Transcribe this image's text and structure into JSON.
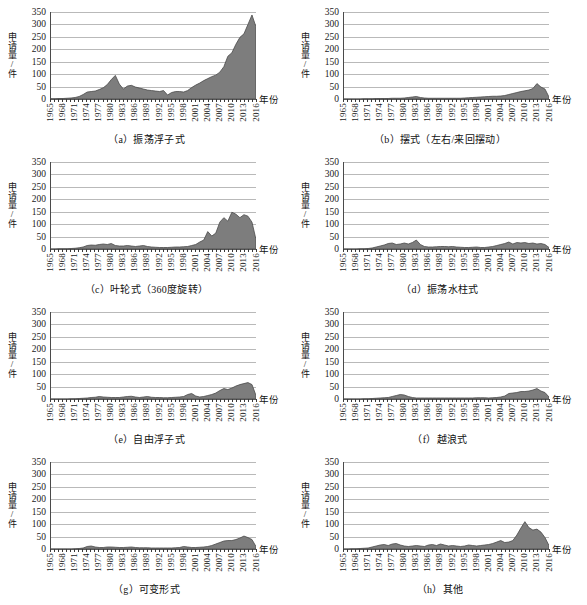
{
  "figure": {
    "axis_titles": {
      "y": "申请量/件",
      "x": "年份"
    },
    "y_ticks": [
      0,
      50,
      100,
      150,
      200,
      250,
      300,
      350
    ],
    "y_range": [
      0,
      350
    ],
    "x_tick_labels": [
      "1965",
      "1968",
      "1971",
      "1974",
      "1977",
      "1980",
      "1983",
      "1986",
      "1989",
      "1992",
      "1995",
      "1998",
      "2001",
      "2004",
      "2007",
      "2010",
      "2013",
      "2016"
    ],
    "x_range": [
      1965,
      2016
    ],
    "colors": {
      "area_fill": "#7d7d7d",
      "area_line": "#4a4a4a",
      "gridline": "#b9b9b9",
      "axis": "#4a4a4a",
      "text": "#111111"
    }
  },
  "chart_data": [
    {
      "type": "area",
      "panel": "a",
      "title": "（a）振荡浮子式",
      "xlabel": "年份",
      "ylabel": "申请量/件",
      "ylim": [
        0,
        350
      ],
      "xlim": [
        1965,
        2016
      ],
      "grid": true,
      "legend": "none",
      "x": [
        1965,
        1966,
        1967,
        1968,
        1969,
        1970,
        1971,
        1972,
        1973,
        1974,
        1975,
        1976,
        1977,
        1978,
        1979,
        1980,
        1981,
        1982,
        1983,
        1984,
        1985,
        1986,
        1987,
        1988,
        1989,
        1990,
        1991,
        1992,
        1993,
        1994,
        1995,
        1996,
        1997,
        1998,
        1999,
        2000,
        2001,
        2002,
        2003,
        2004,
        2005,
        2006,
        2007,
        2008,
        2009,
        2010,
        2011,
        2012,
        2013,
        2014,
        2015,
        2016
      ],
      "values": [
        1,
        1,
        2,
        2,
        3,
        4,
        6,
        10,
        18,
        28,
        30,
        32,
        38,
        45,
        58,
        78,
        95,
        60,
        40,
        52,
        55,
        48,
        44,
        40,
        36,
        34,
        32,
        30,
        34,
        16,
        26,
        30,
        30,
        28,
        34,
        46,
        56,
        64,
        74,
        82,
        90,
        96,
        108,
        130,
        172,
        186,
        220,
        248,
        262,
        300,
        338,
        290
      ]
    },
    {
      "type": "area",
      "panel": "b",
      "title": "（b）摆式（左右/来回摆动）",
      "xlabel": "年份",
      "ylabel": "申请量/件",
      "ylim": [
        0,
        350
      ],
      "xlim": [
        1965,
        2016
      ],
      "grid": true,
      "legend": "none",
      "x": [
        1965,
        1966,
        1967,
        1968,
        1969,
        1970,
        1971,
        1972,
        1973,
        1974,
        1975,
        1976,
        1977,
        1978,
        1979,
        1980,
        1981,
        1982,
        1983,
        1984,
        1985,
        1986,
        1987,
        1988,
        1989,
        1990,
        1991,
        1992,
        1993,
        1994,
        1995,
        1996,
        1997,
        1998,
        1999,
        2000,
        2001,
        2002,
        2003,
        2004,
        2005,
        2006,
        2007,
        2008,
        2009,
        2010,
        2011,
        2012,
        2013,
        2014,
        2015,
        2016
      ],
      "values": [
        0,
        0,
        0,
        0,
        0,
        1,
        1,
        1,
        2,
        2,
        2,
        2,
        3,
        3,
        3,
        4,
        6,
        8,
        10,
        6,
        4,
        3,
        3,
        3,
        3,
        3,
        3,
        3,
        3,
        3,
        4,
        5,
        6,
        7,
        8,
        9,
        10,
        11,
        11,
        12,
        14,
        18,
        22,
        26,
        30,
        33,
        36,
        42,
        62,
        48,
        40,
        8
      ]
    },
    {
      "type": "area",
      "panel": "c",
      "title": "（c）叶轮式（360度旋转）",
      "xlabel": "年份",
      "ylabel": "申请量/件",
      "ylim": [
        0,
        350
      ],
      "xlim": [
        1965,
        2016
      ],
      "grid": true,
      "legend": "none",
      "x": [
        1965,
        1966,
        1967,
        1968,
        1969,
        1970,
        1971,
        1972,
        1973,
        1974,
        1975,
        1976,
        1977,
        1978,
        1979,
        1980,
        1981,
        1982,
        1983,
        1984,
        1985,
        1986,
        1987,
        1988,
        1989,
        1990,
        1991,
        1992,
        1993,
        1994,
        1995,
        1996,
        1997,
        1998,
        1999,
        2000,
        2001,
        2002,
        2003,
        2004,
        2005,
        2006,
        2007,
        2008,
        2009,
        2010,
        2011,
        2012,
        2013,
        2014,
        2015,
        2016
      ],
      "values": [
        0,
        0,
        1,
        1,
        1,
        2,
        3,
        5,
        8,
        14,
        16,
        15,
        18,
        20,
        18,
        22,
        14,
        12,
        12,
        14,
        12,
        10,
        12,
        14,
        10,
        8,
        7,
        6,
        6,
        6,
        7,
        8,
        8,
        9,
        10,
        14,
        18,
        28,
        36,
        70,
        52,
        64,
        108,
        126,
        112,
        148,
        140,
        126,
        138,
        132,
        108,
        38
      ]
    },
    {
      "type": "area",
      "panel": "d",
      "title": "（d）振荡水柱式",
      "xlabel": "年份",
      "ylabel": "申请量/件",
      "ylim": [
        0,
        350
      ],
      "xlim": [
        1965,
        2016
      ],
      "grid": true,
      "legend": "none",
      "x": [
        1965,
        1966,
        1967,
        1968,
        1969,
        1970,
        1971,
        1972,
        1973,
        1974,
        1975,
        1976,
        1977,
        1978,
        1979,
        1980,
        1981,
        1982,
        1983,
        1984,
        1985,
        1986,
        1987,
        1988,
        1989,
        1990,
        1991,
        1992,
        1993,
        1994,
        1995,
        1996,
        1997,
        1998,
        1999,
        2000,
        2001,
        2002,
        2003,
        2004,
        2005,
        2006,
        2007,
        2008,
        2009,
        2010,
        2011,
        2012,
        2013,
        2014,
        2015,
        2016
      ],
      "values": [
        0,
        0,
        0,
        0,
        1,
        1,
        2,
        4,
        8,
        12,
        16,
        22,
        24,
        18,
        20,
        24,
        20,
        26,
        36,
        18,
        10,
        8,
        8,
        9,
        10,
        10,
        9,
        10,
        8,
        7,
        6,
        6,
        7,
        8,
        6,
        6,
        8,
        10,
        14,
        18,
        22,
        28,
        20,
        26,
        24,
        26,
        22,
        24,
        20,
        22,
        18,
        6
      ]
    },
    {
      "type": "area",
      "panel": "e",
      "title": "（e）自由浮子式",
      "xlabel": "年份",
      "ylabel": "申请量/件",
      "ylim": [
        0,
        350
      ],
      "xlim": [
        1965,
        2016
      ],
      "grid": true,
      "legend": "none",
      "x": [
        1965,
        1966,
        1967,
        1968,
        1969,
        1970,
        1971,
        1972,
        1973,
        1974,
        1975,
        1976,
        1977,
        1978,
        1979,
        1980,
        1981,
        1982,
        1983,
        1984,
        1985,
        1986,
        1987,
        1988,
        1989,
        1990,
        1991,
        1992,
        1993,
        1994,
        1995,
        1996,
        1997,
        1998,
        1999,
        2000,
        2001,
        2002,
        2003,
        2004,
        2005,
        2006,
        2007,
        2008,
        2009,
        2010,
        2011,
        2012,
        2013,
        2014,
        2015,
        2016
      ],
      "values": [
        0,
        0,
        0,
        0,
        0,
        1,
        1,
        2,
        3,
        4,
        6,
        7,
        10,
        8,
        7,
        6,
        6,
        6,
        8,
        10,
        11,
        8,
        6,
        8,
        10,
        7,
        6,
        6,
        5,
        5,
        6,
        7,
        8,
        10,
        18,
        22,
        12,
        8,
        10,
        14,
        18,
        24,
        34,
        42,
        38,
        44,
        52,
        58,
        62,
        66,
        58,
        14
      ]
    },
    {
      "type": "area",
      "panel": "f",
      "title": "（f）越浪式",
      "xlabel": "年份",
      "ylabel": "申请量/件",
      "ylim": [
        0,
        350
      ],
      "xlim": [
        1965,
        2016
      ],
      "grid": true,
      "legend": "none",
      "x": [
        1965,
        1966,
        1967,
        1968,
        1969,
        1970,
        1971,
        1972,
        1973,
        1974,
        1975,
        1976,
        1977,
        1978,
        1979,
        1980,
        1981,
        1982,
        1983,
        1984,
        1985,
        1986,
        1987,
        1988,
        1989,
        1990,
        1991,
        1992,
        1993,
        1994,
        1995,
        1996,
        1997,
        1998,
        1999,
        2000,
        2001,
        2002,
        2003,
        2004,
        2005,
        2006,
        2007,
        2008,
        2009,
        2010,
        2011,
        2012,
        2013,
        2014,
        2015,
        2016
      ],
      "values": [
        0,
        0,
        0,
        0,
        0,
        1,
        1,
        2,
        3,
        4,
        5,
        6,
        10,
        14,
        18,
        16,
        10,
        6,
        4,
        4,
        4,
        4,
        4,
        4,
        4,
        4,
        4,
        4,
        4,
        4,
        4,
        4,
        4,
        5,
        5,
        5,
        4,
        5,
        6,
        8,
        12,
        22,
        24,
        26,
        30,
        30,
        32,
        36,
        42,
        32,
        26,
        8
      ]
    },
    {
      "type": "area",
      "panel": "g",
      "title": "（g）可变形式",
      "xlabel": "年份",
      "ylabel": "申请量/件",
      "ylim": [
        0,
        350
      ],
      "xlim": [
        1965,
        2016
      ],
      "grid": true,
      "legend": "none",
      "x": [
        1965,
        1966,
        1967,
        1968,
        1969,
        1970,
        1971,
        1972,
        1973,
        1974,
        1975,
        1976,
        1977,
        1978,
        1979,
        1980,
        1981,
        1982,
        1983,
        1984,
        1985,
        1986,
        1987,
        1988,
        1989,
        1990,
        1991,
        1992,
        1993,
        1994,
        1995,
        1996,
        1997,
        1998,
        1999,
        2000,
        2001,
        2002,
        2003,
        2004,
        2005,
        2006,
        2007,
        2008,
        2009,
        2010,
        2011,
        2012,
        2013,
        2014,
        2015,
        2016
      ],
      "values": [
        0,
        0,
        0,
        0,
        0,
        0,
        1,
        2,
        4,
        10,
        12,
        8,
        6,
        6,
        8,
        8,
        7,
        6,
        6,
        7,
        8,
        6,
        5,
        5,
        5,
        4,
        4,
        4,
        4,
        4,
        4,
        5,
        6,
        10,
        8,
        6,
        6,
        7,
        8,
        10,
        14,
        20,
        26,
        32,
        34,
        34,
        38,
        44,
        52,
        46,
        38,
        10
      ]
    },
    {
      "type": "area",
      "panel": "h",
      "title": "（h）其他",
      "xlabel": "年份",
      "ylabel": "申请量/件",
      "ylim": [
        0,
        350
      ],
      "xlim": [
        1965,
        2016
      ],
      "grid": true,
      "legend": "none",
      "x": [
        1965,
        1966,
        1967,
        1968,
        1969,
        1970,
        1971,
        1972,
        1973,
        1974,
        1975,
        1976,
        1977,
        1978,
        1979,
        1980,
        1981,
        1982,
        1983,
        1984,
        1985,
        1986,
        1987,
        1988,
        1989,
        1990,
        1991,
        1992,
        1993,
        1994,
        1995,
        1996,
        1997,
        1998,
        1999,
        2000,
        2001,
        2002,
        2003,
        2004,
        2005,
        2006,
        2007,
        2008,
        2009,
        2010,
        2011,
        2012,
        2013,
        2014,
        2015,
        2016
      ],
      "values": [
        0,
        0,
        1,
        1,
        2,
        3,
        4,
        8,
        12,
        16,
        18,
        14,
        20,
        22,
        16,
        12,
        10,
        12,
        14,
        12,
        10,
        16,
        18,
        14,
        20,
        16,
        12,
        14,
        12,
        10,
        12,
        16,
        14,
        12,
        14,
        16,
        18,
        22,
        28,
        34,
        26,
        28,
        34,
        56,
        84,
        110,
        86,
        76,
        80,
        68,
        46,
        14
      ]
    }
  ]
}
